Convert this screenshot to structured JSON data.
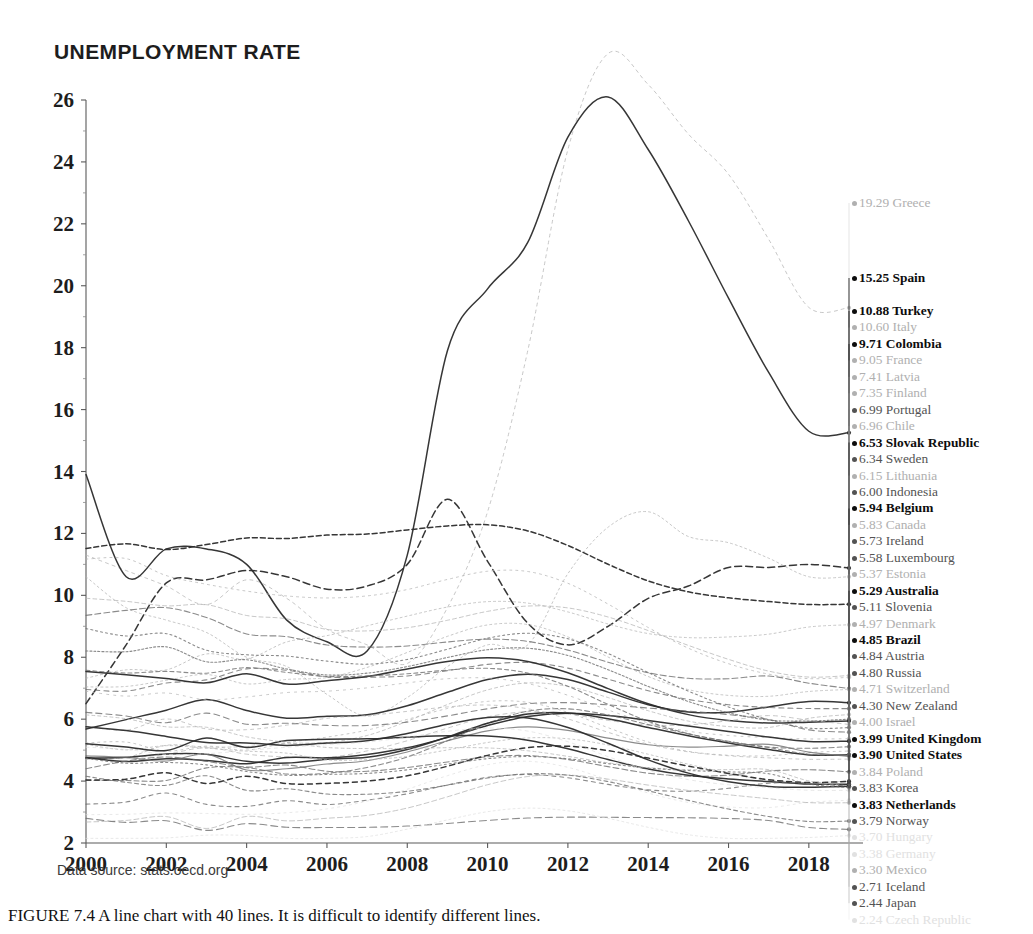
{
  "title": "UNEMPLOYMENT RATE",
  "source_note": "Data source: stats.oecd.org",
  "caption": "FIGURE 7.4 A line chart with 40 lines. It is difficult to identify different lines.",
  "chart_data": {
    "type": "line",
    "title": "UNEMPLOYMENT RATE",
    "xlabel": "",
    "ylabel": "",
    "xlim": [
      2000,
      2019
    ],
    "ylim": [
      2,
      26
    ],
    "yticks": [
      26,
      24,
      22,
      20,
      18,
      16,
      14,
      12,
      10,
      8,
      6,
      4,
      2
    ],
    "xticks": [
      2000,
      2002,
      2004,
      2006,
      2008,
      2010,
      2012,
      2014,
      2016,
      2018
    ],
    "grid": false,
    "legend_position": "right-end-labels",
    "x": [
      2000,
      2001,
      2002,
      2003,
      2004,
      2005,
      2006,
      2007,
      2008,
      2009,
      2010,
      2011,
      2012,
      2013,
      2014,
      2015,
      2016,
      2017,
      2018,
      2019
    ],
    "series": [
      {
        "name": "Greece",
        "end_value": 19.29,
        "emphasis": "faint",
        "dash": "3,4",
        "values": [
          11.3,
          10.8,
          10.3,
          9.7,
          10.5,
          9.9,
          8.9,
          8.4,
          7.8,
          9.6,
          12.7,
          17.9,
          24.4,
          27.5,
          26.5,
          24.9,
          23.6,
          21.5,
          19.3,
          19.29
        ]
      },
      {
        "name": "Spain",
        "end_value": 15.25,
        "emphasis": "strong",
        "dash": "none",
        "values": [
          13.9,
          10.6,
          11.5,
          11.5,
          11.0,
          9.2,
          8.5,
          8.2,
          11.3,
          17.9,
          19.9,
          21.4,
          24.8,
          26.1,
          24.4,
          22.1,
          19.6,
          17.2,
          15.3,
          15.25
        ]
      },
      {
        "name": "Turkey",
        "end_value": 10.88,
        "emphasis": "strong",
        "dash": "7,4",
        "values": [
          6.5,
          8.4,
          10.4,
          10.5,
          10.8,
          10.6,
          10.2,
          10.3,
          11.0,
          13.1,
          11.1,
          9.1,
          8.4,
          9.0,
          9.9,
          10.3,
          10.9,
          10.9,
          11.0,
          10.88
        ]
      },
      {
        "name": "Italy",
        "end_value": 10.6,
        "emphasis": "faint",
        "dash": "2,3",
        "values": [
          10.6,
          9.6,
          9.2,
          8.8,
          8.0,
          7.7,
          6.8,
          6.1,
          6.7,
          7.7,
          8.4,
          8.4,
          10.7,
          12.2,
          12.7,
          11.9,
          11.7,
          11.2,
          10.6,
          10.6
        ]
      },
      {
        "name": "Colombia",
        "end_value": 9.71,
        "emphasis": "strong",
        "dash": "5,3"
      },
      {
        "name": "France",
        "end_value": 9.05,
        "emphasis": "faint",
        "dash": "2,3"
      },
      {
        "name": "Latvia",
        "end_value": 7.41,
        "emphasis": "faint",
        "dash": "4,3"
      },
      {
        "name": "Finland",
        "end_value": 7.35,
        "emphasis": "faint",
        "dash": "2,4"
      },
      {
        "name": "Portugal",
        "end_value": 6.99,
        "emphasis": "medium",
        "dash": "6,3"
      },
      {
        "name": "Chile",
        "end_value": 6.96,
        "emphasis": "faint",
        "dash": "2,3"
      },
      {
        "name": "Slovak Republic",
        "end_value": 6.53,
        "emphasis": "strong",
        "dash": "none"
      },
      {
        "name": "Sweden",
        "end_value": 6.34,
        "emphasis": "medium",
        "dash": "5,4"
      },
      {
        "name": "Lithuania",
        "end_value": 6.15,
        "emphasis": "faint",
        "dash": "3,3"
      },
      {
        "name": "Indonesia",
        "end_value": 6.0,
        "emphasis": "medium",
        "dash": "2,2"
      },
      {
        "name": "Belgium",
        "end_value": 5.94,
        "emphasis": "strong",
        "dash": "none"
      },
      {
        "name": "Canada",
        "end_value": 5.83,
        "emphasis": "faint",
        "dash": "4,4"
      },
      {
        "name": "Ireland",
        "end_value": 5.73,
        "emphasis": "medium",
        "dash": "2,3"
      },
      {
        "name": "Luxembourg",
        "end_value": 5.58,
        "emphasis": "medium",
        "dash": "6,4"
      },
      {
        "name": "Estonia",
        "end_value": 5.37,
        "emphasis": "faint",
        "dash": "2,5"
      },
      {
        "name": "Australia",
        "end_value": 5.29,
        "emphasis": "strong",
        "dash": "none"
      },
      {
        "name": "Slovenia",
        "end_value": 5.11,
        "emphasis": "medium",
        "dash": "5,3"
      },
      {
        "name": "Denmark",
        "end_value": 4.97,
        "emphasis": "faint",
        "dash": "2,4"
      },
      {
        "name": "Brazil",
        "end_value": 4.85,
        "emphasis": "strong",
        "dash": "none"
      },
      {
        "name": "Austria",
        "end_value": 4.84,
        "emphasis": "medium",
        "dash": "4,3"
      },
      {
        "name": "Russia",
        "end_value": 4.8,
        "emphasis": "medium",
        "dash": "none"
      },
      {
        "name": "Switzerland",
        "end_value": 4.71,
        "emphasis": "faint",
        "dash": "3,4"
      },
      {
        "name": "New Zealand",
        "end_value": 4.3,
        "emphasis": "medium",
        "dash": "6,3"
      },
      {
        "name": "Israel",
        "end_value": 4.0,
        "emphasis": "faint",
        "dash": "2,3"
      },
      {
        "name": "United Kingdom",
        "end_value": 3.99,
        "emphasis": "strong",
        "dash": "5,4"
      },
      {
        "name": "United States",
        "end_value": 3.9,
        "emphasis": "strong",
        "dash": "none"
      },
      {
        "name": "Poland",
        "end_value": 3.84,
        "emphasis": "faint",
        "dash": "3,3"
      },
      {
        "name": "Korea",
        "end_value": 3.83,
        "emphasis": "medium",
        "dash": "4,4"
      },
      {
        "name": "Netherlands",
        "end_value": 3.83,
        "emphasis": "strong",
        "dash": "none"
      },
      {
        "name": "Norway",
        "end_value": 3.79,
        "emphasis": "medium",
        "dash": "2,3"
      },
      {
        "name": "Hungary",
        "end_value": 3.7,
        "emphasis": "ghost",
        "dash": "3,4"
      },
      {
        "name": "Germany",
        "end_value": 3.38,
        "emphasis": "ghost",
        "dash": "2,4"
      },
      {
        "name": "Mexico",
        "end_value": 3.3,
        "emphasis": "faint",
        "dash": "5,3"
      },
      {
        "name": "Iceland",
        "end_value": 2.71,
        "emphasis": "medium",
        "dash": "4,3"
      },
      {
        "name": "Japan",
        "end_value": 2.44,
        "emphasis": "medium",
        "dash": "7,4"
      },
      {
        "name": "Czech Republic",
        "end_value": 2.24,
        "emphasis": "ghost",
        "dash": "2,3"
      }
    ]
  }
}
